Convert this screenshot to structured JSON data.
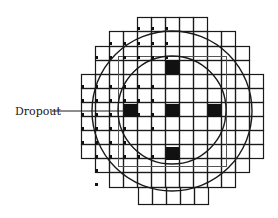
{
  "diagram": {
    "type": "wafer-die-map",
    "colors": {
      "background": "#ffffff",
      "line": "#1a1a1a",
      "fill": "#111111",
      "frame": "#555555"
    },
    "cell": {
      "w": 14,
      "h": 14
    },
    "rows": [
      {
        "y": 17,
        "h": 14,
        "x0": 137,
        "x1": 207
      },
      {
        "y": 31,
        "h": 15,
        "x0": 109,
        "x1": 235
      },
      {
        "y": 46,
        "h": 14,
        "x0": 95,
        "x1": 249
      },
      {
        "y": 60,
        "h": 14,
        "x0": 95,
        "x1": 249
      },
      {
        "y": 74,
        "h": 14,
        "x0": 81,
        "x1": 263
      },
      {
        "y": 88,
        "h": 14,
        "x0": 81,
        "x1": 263
      },
      {
        "y": 102,
        "h": 14,
        "x0": 81,
        "x1": 263
      },
      {
        "y": 116,
        "h": 14,
        "x0": 81,
        "x1": 263
      },
      {
        "y": 130,
        "h": 14,
        "x0": 81,
        "x1": 263
      },
      {
        "y": 144,
        "h": 14,
        "x0": 81,
        "x1": 263
      },
      {
        "y": 158,
        "h": 14,
        "x0": 95,
        "x1": 249
      },
      {
        "y": 172,
        "h": 15,
        "x0": 109,
        "x1": 235
      },
      {
        "y": 187,
        "h": 17,
        "x0": 138,
        "x1": 208
      }
    ],
    "offset_frame": {
      "x": 118,
      "y": 56,
      "w": 108,
      "h": 110
    },
    "circles": [
      {
        "name": "outer-wafer-circle",
        "cx": 172,
        "cy": 111,
        "r": 80
      },
      {
        "name": "inner-wafer-circle",
        "cx": 172,
        "cy": 110,
        "r": 54
      }
    ],
    "filled_dies": [
      {
        "x": 166,
        "y": 60,
        "w": 13,
        "h": 14
      },
      {
        "x": 124,
        "y": 104,
        "w": 14,
        "h": 13
      },
      {
        "x": 166,
        "y": 104,
        "w": 13,
        "h": 13
      },
      {
        "x": 208,
        "y": 104,
        "w": 13,
        "h": 13
      },
      {
        "x": 166,
        "y": 147,
        "w": 13,
        "h": 13
      }
    ],
    "dot_markers": [
      [
        137,
        30
      ],
      [
        151,
        30
      ],
      [
        165,
        30
      ],
      [
        109,
        45
      ],
      [
        123,
        45
      ],
      [
        137,
        45
      ],
      [
        151,
        45
      ],
      [
        165,
        45
      ],
      [
        95,
        59
      ],
      [
        109,
        59
      ],
      [
        123,
        59
      ],
      [
        137,
        59
      ],
      [
        151,
        59
      ],
      [
        165,
        59
      ],
      [
        81,
        88
      ],
      [
        95,
        88
      ],
      [
        109,
        88
      ],
      [
        123,
        88
      ],
      [
        137,
        88
      ],
      [
        151,
        88
      ],
      [
        81,
        102
      ],
      [
        95,
        102
      ],
      [
        109,
        102
      ],
      [
        123,
        102
      ],
      [
        137,
        102
      ],
      [
        151,
        102
      ],
      [
        81,
        116
      ],
      [
        95,
        116
      ],
      [
        109,
        116
      ],
      [
        137,
        116
      ],
      [
        151,
        116
      ],
      [
        165,
        116
      ],
      [
        81,
        130
      ],
      [
        95,
        130
      ],
      [
        109,
        130
      ],
      [
        123,
        130
      ],
      [
        151,
        130
      ],
      [
        81,
        144
      ],
      [
        95,
        144
      ],
      [
        109,
        144
      ],
      [
        123,
        144
      ],
      [
        95,
        158
      ],
      [
        109,
        158
      ],
      [
        123,
        158
      ],
      [
        137,
        158
      ],
      [
        151,
        158
      ],
      [
        95,
        172
      ],
      [
        95,
        186
      ]
    ],
    "callout": {
      "label": "Dropout",
      "text_x": 15,
      "text_y": 115,
      "line_x1": 52,
      "line_y": 111,
      "line_x2": 124
    }
  }
}
